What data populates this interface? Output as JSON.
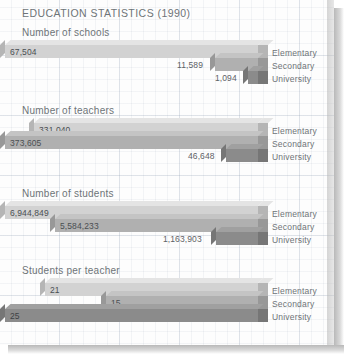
{
  "page": {
    "title": "EDUCATION STATISTICS (1990)"
  },
  "categories": [
    "Elementary",
    "Secondary",
    "University"
  ],
  "colors": {
    "elementary": "#d2d2d2",
    "secondary": "#b0b0b0",
    "university": "#8b8b8b",
    "elementary_top": "#e4e4e4",
    "secondary_top": "#c4c4c4",
    "university_top": "#a0a0a0",
    "elementary_side": "#b5b5b5",
    "secondary_side": "#989898",
    "university_side": "#767676",
    "text": "#6e7478",
    "paper": "#fdfdfd",
    "grid": "#96a5b9"
  },
  "chart_data": [
    {
      "type": "bar",
      "orientation": "horizontal-3d",
      "title": "Number of schools",
      "categories": [
        "Elementary",
        "Secondary",
        "University"
      ],
      "values": [
        67504,
        11589,
        1094
      ],
      "labels": [
        "67,504",
        "11,589",
        "1,094"
      ],
      "xlabel": "",
      "ylabel": "",
      "grid": true,
      "max": 67504
    },
    {
      "type": "bar",
      "orientation": "horizontal-3d",
      "title": "Number of teachers",
      "categories": [
        "Elementary",
        "Secondary",
        "University"
      ],
      "values": [
        331040,
        373605,
        46648
      ],
      "labels": [
        "331,040",
        "373,605",
        "46,648"
      ],
      "xlabel": "",
      "ylabel": "",
      "grid": true,
      "max": 373605
    },
    {
      "type": "bar",
      "orientation": "horizontal-3d",
      "title": "Number of students",
      "categories": [
        "Elementary",
        "Secondary",
        "University"
      ],
      "values": [
        6944849,
        5584233,
        1163903
      ],
      "labels": [
        "6,944,849",
        "5,584,233",
        "1,163,903"
      ],
      "xlabel": "",
      "ylabel": "",
      "grid": true,
      "max": 6944849
    },
    {
      "type": "bar",
      "orientation": "horizontal-3d",
      "title": "Students per teacher",
      "categories": [
        "Elementary",
        "Secondary",
        "University"
      ],
      "values": [
        21,
        15,
        25
      ],
      "labels": [
        "21",
        "15",
        "25"
      ],
      "xlabel": "",
      "ylabel": "",
      "grid": true,
      "max": 25
    }
  ]
}
